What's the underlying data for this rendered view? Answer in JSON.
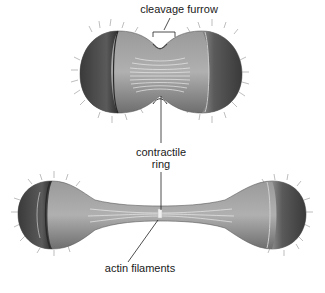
{
  "figure": {
    "type": "biological-illustration",
    "colors": {
      "background": "#ffffff",
      "cell_shade_dark": "#4a4a4a",
      "cell_shade_mid": "#8a8a8a",
      "cell_shade_light": "#b8b8b8",
      "filament": "#e6e6e6",
      "leader_line": "#222222",
      "label_text": "#1a1a1a"
    }
  },
  "labels": {
    "cleavage_furrow": "cleavage furrow",
    "contractile_ring_line1": "contractile",
    "contractile_ring_line2": "ring",
    "actin_filaments": "actin filaments"
  },
  "stages": [
    {
      "name": "early-furrowing",
      "description": "dumbbell cell with pinched cleavage furrow"
    },
    {
      "name": "late-furrowing",
      "description": "two spheres joined by narrow cytoplasmic bridge"
    }
  ]
}
